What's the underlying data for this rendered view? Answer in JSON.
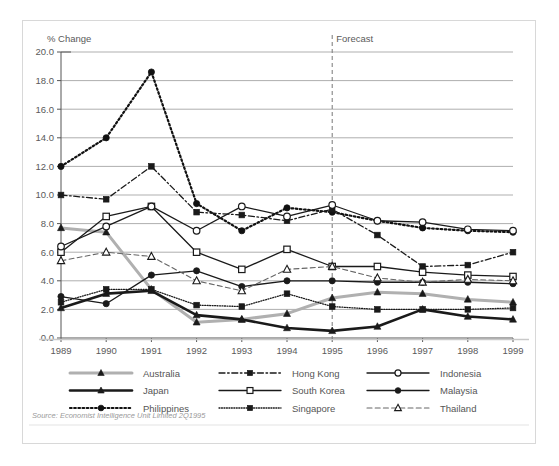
{
  "figure": {
    "axis_title": "% Change",
    "forecast_label": "Forecast",
    "source": "Source: Economist Intelligence Unit Limited 2Q1995"
  },
  "chart_data": {
    "type": "line",
    "title": "",
    "xlabel": "",
    "ylabel": "% Change",
    "ylim": [
      0.0,
      20.0
    ],
    "ytick_step": 2.0,
    "grid": true,
    "legend_position": "bottom",
    "annotations": [
      {
        "text": "Forecast",
        "x": "1995",
        "style": "dashed-vertical-line"
      }
    ],
    "x": [
      "1989",
      "1990",
      "1991",
      "1992",
      "1993",
      "1994",
      "1995",
      "1996",
      "1997",
      "1998",
      "1999"
    ],
    "ytick_labels": [
      "0.0",
      "2.0",
      "4.0",
      "6.0",
      "8.0",
      "10.0",
      "12.0",
      "14.0",
      "16.0",
      "18.0",
      "20.0"
    ],
    "series": [
      {
        "name": "Australia",
        "color": "#b0b0b0",
        "line": "solid",
        "width": 3.0,
        "marker": "triangle-filled",
        "marker_fill": "#1a1a1a",
        "values": [
          7.7,
          7.4,
          3.4,
          1.1,
          1.3,
          1.7,
          2.8,
          3.2,
          3.1,
          2.7,
          2.5
        ]
      },
      {
        "name": "Japan",
        "color": "#1a1a1a",
        "line": "solid",
        "width": 2.6,
        "marker": "triangle-filled",
        "marker_fill": "#1a1a1a",
        "values": [
          2.1,
          3.1,
          3.3,
          1.6,
          1.3,
          0.7,
          0.5,
          0.8,
          2.0,
          1.5,
          1.3
        ]
      },
      {
        "name": "Philippines",
        "color": "#111111",
        "line": "dotted",
        "width": 2.2,
        "marker": "circle-filled",
        "marker_fill": "#111111",
        "values": [
          12.0,
          14.0,
          18.6,
          9.4,
          7.5,
          9.1,
          8.8,
          8.2,
          7.7,
          7.5,
          7.4
        ]
      },
      {
        "name": "Hong Kong",
        "color": "#1a1a1a",
        "line": "dashdot",
        "width": 1.3,
        "marker": "square-filled",
        "marker_fill": "#1a1a1a",
        "values": [
          10.0,
          9.7,
          12.0,
          8.8,
          8.6,
          8.2,
          9.0,
          7.2,
          5.0,
          5.1,
          6.0
        ]
      },
      {
        "name": "South Korea",
        "color": "#1a1a1a",
        "line": "solid",
        "width": 1.3,
        "marker": "square-open",
        "marker_fill": "#ffffff",
        "values": [
          6.0,
          8.5,
          9.2,
          6.0,
          4.8,
          6.2,
          5.0,
          5.0,
          4.6,
          4.4,
          4.3
        ]
      },
      {
        "name": "Singapore",
        "color": "#1a1a1a",
        "line": "dotted",
        "width": 1.3,
        "marker": "square-filled",
        "marker_fill": "#1a1a1a",
        "values": [
          2.5,
          3.4,
          3.4,
          2.3,
          2.2,
          3.1,
          2.2,
          2.0,
          2.0,
          2.0,
          2.1
        ]
      },
      {
        "name": "Indonesia",
        "color": "#1a1a1a",
        "line": "solid",
        "width": 1.3,
        "marker": "circle-open",
        "marker_fill": "#ffffff",
        "values": [
          6.4,
          7.8,
          9.2,
          7.5,
          9.2,
          8.5,
          9.3,
          8.2,
          8.1,
          7.6,
          7.5
        ]
      },
      {
        "name": "Malaysia",
        "color": "#1a1a1a",
        "line": "solid",
        "width": 1.3,
        "marker": "circle-filled",
        "marker_fill": "#1a1a1a",
        "values": [
          2.9,
          2.4,
          4.4,
          4.7,
          3.6,
          4.0,
          4.0,
          3.9,
          3.9,
          3.9,
          3.8
        ]
      },
      {
        "name": "Thailand",
        "color": "#666666",
        "line": "dashed",
        "width": 1.1,
        "marker": "triangle-open",
        "marker_fill": "#ffffff",
        "values": [
          5.4,
          6.0,
          5.7,
          4.0,
          3.3,
          4.8,
          5.0,
          4.2,
          3.9,
          4.1,
          4.0
        ]
      }
    ]
  },
  "legend": {
    "columns": [
      [
        "Australia",
        "Japan",
        "Philippines"
      ],
      [
        "Hong Kong",
        "South Korea",
        "Singapore"
      ],
      [
        "Indonesia",
        "Malaysia",
        "Thailand"
      ]
    ]
  }
}
